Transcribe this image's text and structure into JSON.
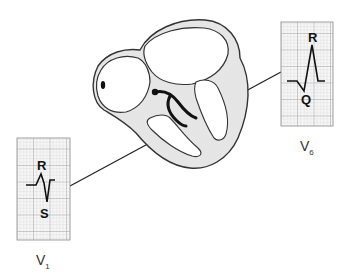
{
  "diagram": {
    "type": "anatomical-ecg-illustration",
    "leads": [
      {
        "id": "V1",
        "label_main": "V",
        "label_sub": "1",
        "wave_labels": {
          "top": "R",
          "bottom": "S"
        },
        "pattern": "small R, deep S (rS complex)"
      },
      {
        "id": "V6",
        "label_main": "V",
        "label_sub": "6",
        "wave_labels": {
          "top": "R",
          "bottom": "Q"
        },
        "pattern": "small Q, tall R (qR complex)"
      }
    ],
    "colors": {
      "grid_line": "#b8b8b8",
      "grid_bg": "#f4f4f4",
      "trace": "#111111",
      "heart_wall": "#d9d9d9",
      "outline": "#333333"
    }
  }
}
